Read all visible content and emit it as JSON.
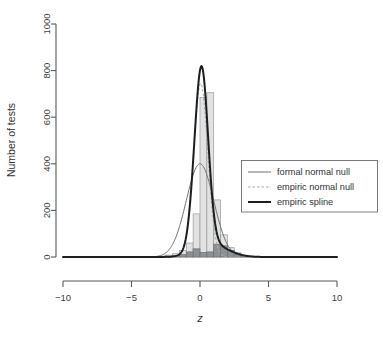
{
  "chart_data": {
    "type": "bar",
    "title": "",
    "xlabel": "z",
    "ylabel": "Number of tests",
    "xlim": [
      -10,
      10
    ],
    "ylim": [
      0,
      1000
    ],
    "grid": false,
    "xticks": [
      -10,
      -5,
      0,
      5,
      10
    ],
    "xtick_labels": [
      "-10",
      "-5",
      "0",
      "5",
      "10"
    ],
    "yticks": [
      0,
      200,
      400,
      600,
      800,
      1000
    ],
    "ytick_labels": [
      "0",
      "200",
      "400",
      "600",
      "800",
      "1000"
    ],
    "legend_position": "center-right",
    "legend_entries": [
      {
        "label": "formal normal null",
        "style": "thin-solid-gray",
        "color": "#6f7477"
      },
      {
        "label": "empiric normal null",
        "style": "dashed-light-gray",
        "color": "#a8abad"
      },
      {
        "label": "empiric spline",
        "style": "thick-solid-black",
        "color": "#1c1f21"
      }
    ],
    "histogram": {
      "bin_width": 0.5,
      "bin_left_edges": [
        -3.5,
        -3.0,
        -2.5,
        -2.0,
        -1.5,
        -1.0,
        -0.5,
        0.0,
        0.5,
        1.0,
        1.5,
        2.0,
        2.5,
        3.0
      ],
      "counts_total": [
        2,
        4,
        8,
        14,
        28,
        60,
        185,
        685,
        705,
        245,
        95,
        40,
        18,
        6
      ],
      "counts_nonnull": [
        0,
        1,
        2,
        5,
        10,
        22,
        35,
        20,
        22,
        55,
        48,
        28,
        12,
        4
      ]
    },
    "series": [
      {
        "name": "formal normal null",
        "type": "line",
        "distribution": "normal",
        "mean": 0.0,
        "sd": 1.0,
        "peak_height": 400,
        "color": "#6f7477"
      },
      {
        "name": "empiric normal null",
        "type": "line",
        "distribution": "normal",
        "mean": 0.05,
        "sd": 0.52,
        "peak_height": 745,
        "color": "#a8abad"
      },
      {
        "name": "empiric spline",
        "type": "line",
        "distribution": "spline",
        "mean": 0.05,
        "sd": 0.5,
        "peak_height": 775,
        "color": "#1c1f21"
      }
    ]
  },
  "axes": {
    "y_title": "Number of tests",
    "x_title": "z"
  }
}
